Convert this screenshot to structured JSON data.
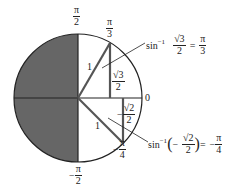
{
  "diagram": {
    "circle": {
      "cx": 78,
      "cy": 98,
      "r": 64,
      "shade_color": "#666666",
      "stroke_color": "#222222"
    },
    "angle_labels": {
      "top": {
        "sign": "",
        "num": "π",
        "den": "2"
      },
      "pi3": {
        "sign": "",
        "num": "π",
        "den": "3"
      },
      "zero": "0",
      "negpi4": {
        "sign": "−",
        "num": "π",
        "den": "4"
      },
      "bottom": {
        "sign": "−",
        "num": "π",
        "den": "2"
      }
    },
    "segment_labels": {
      "hyp_upper": "1",
      "hyp_lower": "1",
      "opp_upper": {
        "sign": "",
        "num": "√3",
        "den": "2"
      },
      "opp_lower": {
        "sign": "−",
        "num": "√2",
        "den": "2"
      }
    },
    "annotations": {
      "upper": {
        "func": "sin",
        "exp": "−1",
        "arg_num": "√3",
        "arg_den": "2",
        "eq": "=",
        "res_sign": "",
        "res_num": "π",
        "res_den": "3"
      },
      "lower": {
        "func": "sin",
        "exp": "−1",
        "lparen": "(",
        "arg_sign": "−",
        "arg_num": "√2",
        "arg_den": "2",
        "rparen": ")",
        "eq": "=",
        "res_sign": "−",
        "res_num": "π",
        "res_den": "4"
      }
    }
  }
}
